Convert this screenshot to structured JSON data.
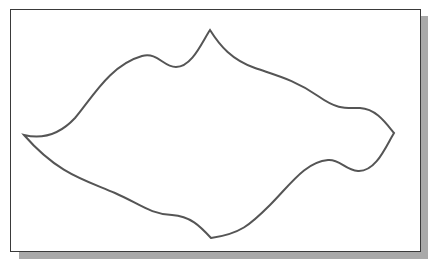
{
  "figure": {
    "frame": {
      "border_color": "#3a3a3a",
      "background": "#ffffff",
      "shadow_color": "#a9a9a9"
    },
    "curve": {
      "stroke_color": "#555555",
      "stroke_width": 2,
      "fill": "none",
      "key_points": {
        "left_tip": [
          24,
          135
        ],
        "top_peak": [
          210,
          30
        ],
        "right_tip": [
          394,
          133
        ],
        "bottom_tip": [
          211,
          238
        ],
        "upper_left_hump": [
          142,
          56
        ],
        "upper_left_valley": [
          173,
          68
        ],
        "lower_right_hump": [
          330,
          160
        ],
        "lower_right_valley": [
          358,
          171
        ]
      },
      "path": "M 24 135 C 45 140, 62 132, 75 118 C 92 98, 110 65, 142 56 C 158 52, 163 67, 176 67 C 192 67, 202 42, 210 30 C 220 46, 232 60, 255 68 C 278 76, 295 80, 318 96 C 338 110, 345 108, 360 108 C 376 109, 385 122, 394 133 C 386 146, 376 172, 358 171 C 345 170, 340 159, 328 160 C 305 162, 290 185, 270 205 C 250 225, 240 234, 211 238 C 200 226, 190 216, 172 215 C 150 214, 140 204, 115 193 C 85 180, 58 174, 24 135 Z"
    }
  }
}
